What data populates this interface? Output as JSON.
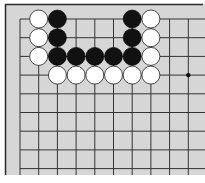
{
  "board": {
    "background": "#d6d6d6",
    "line_color": "#333333",
    "edge_color": "#2a2a2a",
    "origin_x": 20,
    "origin_y": 19,
    "spacing": 18.7,
    "cols": 10,
    "rows": 9,
    "star_points": [
      [
        9,
        3
      ]
    ]
  },
  "stones": [
    {
      "color": "white",
      "col": 1,
      "row": 0
    },
    {
      "color": "black",
      "col": 2,
      "row": 0
    },
    {
      "color": "black",
      "col": 6,
      "row": 0
    },
    {
      "color": "white",
      "col": 7,
      "row": 0
    },
    {
      "color": "white",
      "col": 1,
      "row": 1
    },
    {
      "color": "black",
      "col": 2,
      "row": 1
    },
    {
      "color": "black",
      "col": 6,
      "row": 1
    },
    {
      "color": "white",
      "col": 7,
      "row": 1
    },
    {
      "color": "white",
      "col": 1,
      "row": 2
    },
    {
      "color": "black",
      "col": 2,
      "row": 2
    },
    {
      "color": "black",
      "col": 3,
      "row": 2
    },
    {
      "color": "black",
      "col": 4,
      "row": 2
    },
    {
      "color": "black",
      "col": 5,
      "row": 2
    },
    {
      "color": "black",
      "col": 6,
      "row": 2
    },
    {
      "color": "white",
      "col": 7,
      "row": 2
    },
    {
      "color": "white",
      "col": 2,
      "row": 3
    },
    {
      "color": "white",
      "col": 3,
      "row": 3
    },
    {
      "color": "white",
      "col": 4,
      "row": 3
    },
    {
      "color": "white",
      "col": 5,
      "row": 3
    },
    {
      "color": "white",
      "col": 6,
      "row": 3
    },
    {
      "color": "white",
      "col": 7,
      "row": 3
    }
  ]
}
